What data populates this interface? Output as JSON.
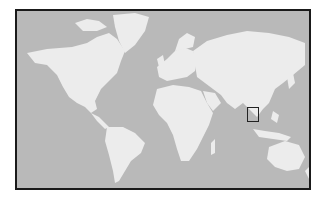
{
  "map": {
    "type": "world-locator-map",
    "projection": "mercator-like",
    "ocean_color": "#b9b9b9",
    "land_color": "#ececec",
    "frame_color": "#1a1a1a",
    "locator_box": {
      "region": "Indochina / South China Sea (Vietnam area)",
      "color": "#222222",
      "x": 230,
      "y": 96,
      "width": 12,
      "height": 15
    }
  }
}
